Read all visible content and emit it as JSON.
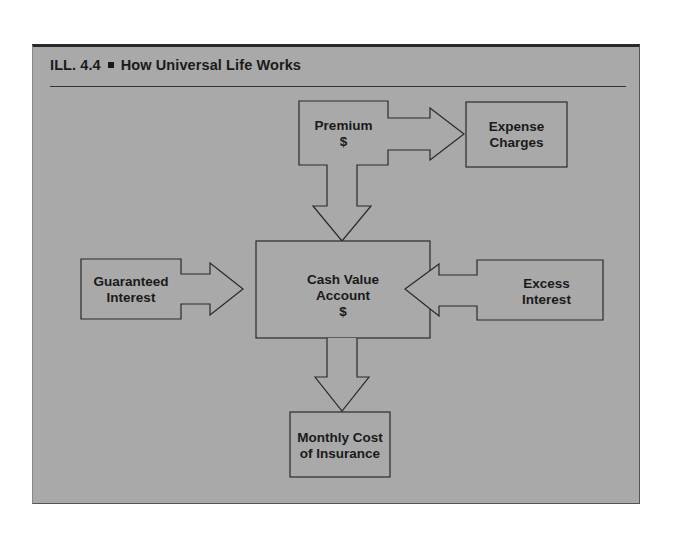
{
  "header": {
    "label": "ILL. 4.4",
    "title": "How Universal Life Works"
  },
  "colors": {
    "panel_background": "#a9a9a9",
    "stroke": "#2a2a2a",
    "text": "#1a1a1a"
  },
  "nodes": {
    "premium": {
      "line1": "Premium",
      "line2": "$"
    },
    "expense_charges": {
      "line1": "Expense",
      "line2": "Charges"
    },
    "cash_value_account": {
      "line1": "Cash Value",
      "line2": "Account",
      "line3": "$"
    },
    "guaranteed_interest": {
      "line1": "Guaranteed",
      "line2": "Interest"
    },
    "excess_interest": {
      "line1": "Excess",
      "line2": "Interest"
    },
    "monthly_cost": {
      "line1": "Monthly Cost",
      "line2": "of Insurance"
    }
  },
  "edges": [
    {
      "from": "Premium $",
      "to": "Expense Charges"
    },
    {
      "from": "Premium $",
      "to": "Cash Value Account $"
    },
    {
      "from": "Guaranteed Interest",
      "to": "Cash Value Account $"
    },
    {
      "from": "Excess Interest",
      "to": "Cash Value Account $"
    },
    {
      "from": "Cash Value Account $",
      "to": "Monthly Cost of Insurance"
    }
  ]
}
